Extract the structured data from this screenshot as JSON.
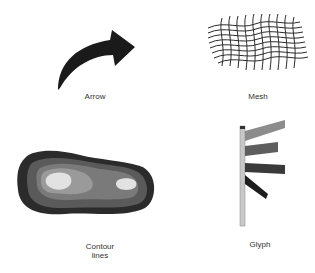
{
  "figure": {
    "panels": [
      {
        "id": "arrow",
        "label": "Arrow",
        "icon": "curved-arrow-icon"
      },
      {
        "id": "mesh",
        "label": "Mesh",
        "icon": "mesh-icon"
      },
      {
        "id": "contour",
        "label": "Contour\nlines",
        "label_line1": "Contour",
        "label_line2": "lines",
        "icon": "contour-lines-icon"
      },
      {
        "id": "glyph",
        "label": "Glyph",
        "icon": "glyph-icon"
      }
    ]
  },
  "colors": {
    "arrow_fill": "#1a1a1a",
    "mesh_stroke": "#2a2a2a",
    "contour_outer": "#2b2b2b",
    "contour_level2": "#5a5a5a",
    "contour_level3": "#7a7a7a",
    "contour_level4": "#9a9a9a",
    "contour_peak": "#e2e2e2",
    "glyph_pole": "#c8c8c8",
    "glyph_bar1": "#8c8c8c",
    "glyph_bar2": "#5e5e5e",
    "glyph_bar3": "#3a3a3a",
    "glyph_bar4": "#1e1e1e",
    "label_text": "#333333"
  }
}
